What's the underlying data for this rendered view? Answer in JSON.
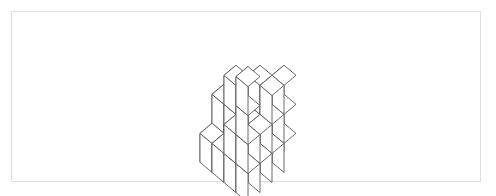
{
  "figure": {
    "kind": "isometric-cube-stack",
    "title": "",
    "caption": "",
    "frame": {
      "x": 11,
      "y": 11,
      "width": 470,
      "height": 171,
      "border_color": "#dededf",
      "background": "#ffffff"
    },
    "render": {
      "line_color": "#5a5a5a",
      "line_width": 0.9,
      "face_top_color": "#ffffff",
      "face_left_color": "#ffffff",
      "face_right_color": "#ffffff",
      "cube_half_width": 24,
      "cube_half_depth": 24,
      "cube_height": 29,
      "iso_x_scale": 1.0,
      "iso_y_scale": 0.42,
      "origin_x": 248,
      "origin_y": 122
    },
    "footprint": {
      "rows": 4,
      "cols": 4,
      "row_axis_label": "",
      "col_axis_label": ""
    },
    "height_map": [
      [
        1,
        2,
        2,
        3
      ],
      [
        1,
        2,
        3,
        3
      ],
      [
        2,
        3,
        1,
        2
      ],
      [
        1,
        1,
        2,
        4
      ]
    ],
    "total_cubes": "33"
  }
}
